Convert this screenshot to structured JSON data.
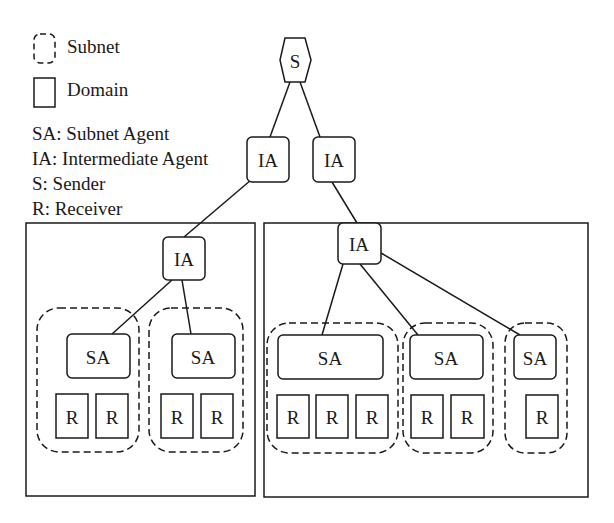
{
  "legend": {
    "subnet_label": "Subnet",
    "domain_label": "Domain",
    "abbreviations": [
      "SA: Subnet Agent",
      "IA: Intermediate Agent",
      "S: Sender",
      "R: Receiver"
    ]
  },
  "nodes": {
    "sender": "S",
    "ia_top_left": "IA",
    "ia_top_right": "IA",
    "ia_left_domain": "IA",
    "ia_right_domain": "IA",
    "sa_left_1": "SA",
    "sa_left_2": "SA",
    "sa_right_1": "SA",
    "sa_right_2": "SA",
    "sa_right_3": "SA",
    "receiver": "R"
  },
  "structure": {
    "domains": [
      {
        "name": "left-domain",
        "subnets": [
          {
            "receivers": 2
          },
          {
            "receivers": 2
          }
        ]
      },
      {
        "name": "right-domain",
        "subnets": [
          {
            "receivers": 3
          },
          {
            "receivers": 2
          },
          {
            "receivers": 1
          }
        ]
      }
    ]
  },
  "colors": {
    "stroke": "#1a1a1a",
    "background": "#ffffff"
  }
}
